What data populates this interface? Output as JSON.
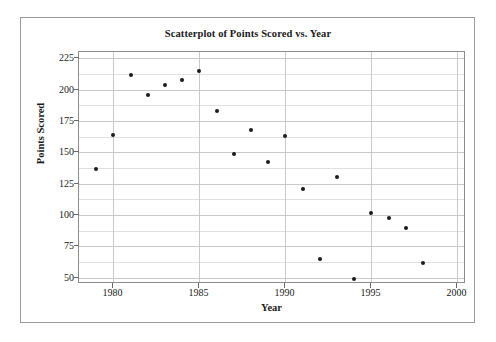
{
  "chart_data": {
    "type": "scatter",
    "title": "Scatterplot of Points Scored vs. Year",
    "xlabel": "Year",
    "ylabel": "Points Scored",
    "xlim": [
      1978,
      2000.5
    ],
    "ylim": [
      45,
      230
    ],
    "grid": true,
    "legend": "none",
    "xticks": [
      1980,
      1985,
      1990,
      1995,
      2000
    ],
    "xtick_labels": [
      "1980",
      "1985",
      "1990",
      "1995",
      "2000"
    ],
    "yticks": [
      50,
      75,
      100,
      125,
      150,
      175,
      200,
      225
    ],
    "ytick_labels": [
      "50",
      "75",
      "100",
      "125",
      "150",
      "175",
      "200",
      "225"
    ],
    "minor_gridlines_y": [
      62.5,
      87.5,
      112.5,
      137.5,
      162.5,
      187.5,
      212.5
    ],
    "marker": "filled-circle",
    "marker_color": "#1b1b1b",
    "grid_color": "#c9c9c9",
    "axis_color": "#8d8d8d",
    "x": [
      1979,
      1980,
      1981,
      1982,
      1983,
      1984,
      1985,
      1986,
      1987,
      1988,
      1989,
      1990,
      1991,
      1992,
      1993,
      1994,
      1995,
      1996,
      1997,
      1998
    ],
    "y": [
      137,
      164,
      212,
      196,
      204,
      208,
      215,
      183,
      149,
      168,
      142,
      163,
      121,
      65,
      130,
      49,
      102,
      98,
      90,
      62
    ],
    "points": [
      {
        "x": 1979,
        "y": 137
      },
      {
        "x": 1980,
        "y": 164
      },
      {
        "x": 1981,
        "y": 212
      },
      {
        "x": 1982,
        "y": 196
      },
      {
        "x": 1983,
        "y": 204
      },
      {
        "x": 1984,
        "y": 208
      },
      {
        "x": 1985,
        "y": 215
      },
      {
        "x": 1986,
        "y": 183
      },
      {
        "x": 1987,
        "y": 149
      },
      {
        "x": 1988,
        "y": 168
      },
      {
        "x": 1989,
        "y": 142
      },
      {
        "x": 1990,
        "y": 163
      },
      {
        "x": 1991,
        "y": 121
      },
      {
        "x": 1992,
        "y": 65
      },
      {
        "x": 1993,
        "y": 130
      },
      {
        "x": 1994,
        "y": 49
      },
      {
        "x": 1995,
        "y": 102
      },
      {
        "x": 1996,
        "y": 98
      },
      {
        "x": 1997,
        "y": 90
      },
      {
        "x": 1998,
        "y": 62
      }
    ]
  }
}
